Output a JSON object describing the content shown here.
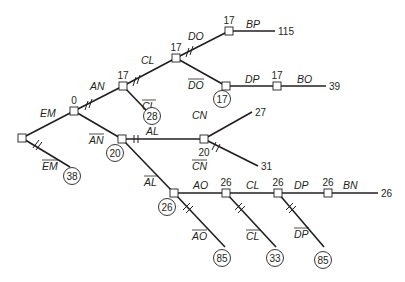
{
  "diagram": {
    "type": "branch-and-bound tree",
    "colors": {
      "ink": "#231f20",
      "background": "#ffffff"
    },
    "nodes": [
      {
        "id": "root",
        "x": 22,
        "y": 138,
        "value": ""
      },
      {
        "id": "EM",
        "x": 74,
        "y": 111,
        "value": "0"
      },
      {
        "id": "AN",
        "x": 123,
        "y": 86,
        "value": "17"
      },
      {
        "id": "notAN",
        "x": 122,
        "y": 139,
        "value": ""
      },
      {
        "id": "CL1",
        "x": 176,
        "y": 58,
        "value": "17"
      },
      {
        "id": "DO",
        "x": 229,
        "y": 31,
        "value": "17"
      },
      {
        "id": "notDO",
        "x": 226,
        "y": 86,
        "value": ""
      },
      {
        "id": "DP1",
        "x": 277,
        "y": 86,
        "value": "17"
      },
      {
        "id": "AL",
        "x": 204,
        "y": 139,
        "value": "20"
      },
      {
        "id": "notAL",
        "x": 174,
        "y": 193,
        "value": ""
      },
      {
        "id": "AO",
        "x": 226,
        "y": 193,
        "value": "26"
      },
      {
        "id": "CL2",
        "x": 278,
        "y": 193,
        "value": "26"
      },
      {
        "id": "DP2",
        "x": 328,
        "y": 193,
        "value": "26"
      }
    ],
    "edges": [
      {
        "from": "root",
        "to": "EM",
        "label": "EM",
        "negated": false
      },
      {
        "from": "root",
        "to": "leafEM",
        "label": "EM",
        "negated": true,
        "ends_at": [
          70,
          167
        ]
      },
      {
        "from": "EM",
        "to": "AN",
        "label": "AN",
        "negated": false
      },
      {
        "from": "EM",
        "to": "notAN",
        "label": "AN",
        "negated": true
      },
      {
        "from": "AN",
        "to": "CL1",
        "label": "CL",
        "negated": false
      },
      {
        "from": "AN",
        "to": "leafCL",
        "label": "CL",
        "negated": true,
        "ends_at": [
          147,
          111
        ]
      },
      {
        "from": "CL1",
        "to": "DO",
        "label": "DO",
        "negated": false
      },
      {
        "from": "CL1",
        "to": "notDO",
        "label": "DO",
        "negated": true
      },
      {
        "from": "DO",
        "to": "endBP",
        "label": "BP",
        "negated": false,
        "ends_at": [
          275,
          31
        ]
      },
      {
        "from": "notDO",
        "to": "DP1",
        "label": "DP",
        "negated": false
      },
      {
        "from": "DP1",
        "to": "endBO",
        "label": "BO",
        "negated": false,
        "ends_at": [
          326,
          86
        ]
      },
      {
        "from": "notAN",
        "to": "AL",
        "label": "AL",
        "negated": false
      },
      {
        "from": "notAN",
        "to": "notAL",
        "label": "AL",
        "negated": true
      },
      {
        "from": "AL",
        "to": "endCN",
        "label": "CN",
        "negated": false,
        "ends_at": [
          252,
          112
        ]
      },
      {
        "from": "AL",
        "to": "endNotCN",
        "label": "CN",
        "negated": true,
        "ends_at": [
          258,
          166
        ]
      },
      {
        "from": "notAL",
        "to": "AO",
        "label": "AO",
        "negated": false
      },
      {
        "from": "AO",
        "to": "CL2",
        "label": "CL",
        "negated": false
      },
      {
        "from": "CL2",
        "to": "DP2",
        "label": "DP",
        "negated": false
      },
      {
        "from": "DP2",
        "to": "endBN",
        "label": "BN",
        "negated": false,
        "ends_at": [
          378,
          193
        ]
      },
      {
        "from": "notAL",
        "to": "leafAO",
        "label": "AO",
        "negated": true,
        "ends_at": [
          225,
          247
        ]
      },
      {
        "from": "AO",
        "to": "leafCL2",
        "label": "CL",
        "negated": true,
        "ends_at": [
          276,
          247
        ]
      },
      {
        "from": "CL2",
        "to": "leafDP",
        "label": "DP",
        "negated": true,
        "ends_at": [
          324,
          247
        ]
      }
    ],
    "node_values": {
      "EM": "0",
      "AN": "17",
      "CL1": "17",
      "DO": "17",
      "DP1": "17",
      "AL": "20",
      "AO": "26",
      "CL2": "26",
      "DP2": "26"
    },
    "edge_labels": {
      "EM": "EM",
      "EM_bar": "EM",
      "AN": "AN",
      "AN_bar": "AN",
      "CL1": "CL",
      "CL1_bar": "CL",
      "DO": "DO",
      "DO_bar": "DO",
      "BP": "BP",
      "DP1": "DP",
      "BO": "BO",
      "AL": "AL",
      "AL_bar": "AL",
      "CN": "CN",
      "CN_bar": "CN",
      "AO": "AO",
      "AO_bar": "AO",
      "CL2": "CL",
      "CL2_bar": "CL",
      "DP2": "DP",
      "DP2_bar": "DP",
      "BN": "BN"
    },
    "terminal_values": {
      "BP_end": "115",
      "BO_end": "39",
      "CN_end": "27",
      "CN_bar_end": "31",
      "BN_end": "26"
    },
    "circled_bounds": {
      "EM_bar": "38",
      "AN_bar": "20",
      "CL1_bar": "28",
      "DO_bar": "17",
      "AL_bar": "26",
      "AO_bar": "85",
      "CL2_bar": "33",
      "DP2_bar": "85"
    }
  }
}
